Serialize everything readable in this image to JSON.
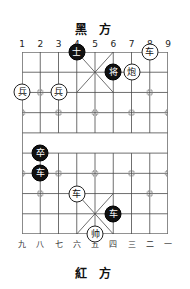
{
  "board": {
    "title_black": "黑 方",
    "title_red": "紅 方",
    "files": 9,
    "ranks": 10,
    "top_coords": [
      "1",
      "2",
      "3",
      "4",
      "5",
      "6",
      "7",
      "8",
      "9"
    ],
    "bottom_coords": [
      "九",
      "八",
      "七",
      "六",
      "五",
      "四",
      "三",
      "二",
      "一"
    ],
    "colors": {
      "line": "#4a4a4a",
      "border": "#6e6e6e",
      "black_piece_bg": "#111111",
      "black_piece_fg": "#ffffff",
      "red_piece_bg": "#ffffff",
      "red_piece_fg": "#111111",
      "background": "#ffffff"
    },
    "pieces": [
      {
        "glyph": "士",
        "side": "black",
        "file": 4,
        "rank": 0,
        "name": "black-advisor"
      },
      {
        "glyph": "车",
        "side": "red",
        "file": 8,
        "rank": 0,
        "name": "red-chariot-1"
      },
      {
        "glyph": "将",
        "side": "black",
        "file": 6,
        "rank": 1,
        "name": "black-general"
      },
      {
        "glyph": "炮",
        "side": "red",
        "file": 7,
        "rank": 1,
        "name": "red-cannon"
      },
      {
        "glyph": "兵",
        "side": "red",
        "file": 1,
        "rank": 2,
        "name": "red-soldier-1"
      },
      {
        "glyph": "兵",
        "side": "red",
        "file": 3,
        "rank": 2,
        "name": "red-soldier-2"
      },
      {
        "glyph": "卒",
        "side": "black",
        "file": 2,
        "rank": 5,
        "name": "black-soldier"
      },
      {
        "glyph": "车",
        "side": "black",
        "file": 2,
        "rank": 6,
        "name": "black-chariot-1"
      },
      {
        "glyph": "车",
        "side": "red",
        "file": 4,
        "rank": 7,
        "name": "red-chariot-2"
      },
      {
        "glyph": "车",
        "side": "black",
        "file": 6,
        "rank": 8,
        "name": "black-chariot-2"
      },
      {
        "glyph": "帅",
        "side": "red",
        "file": 5,
        "rank": 9,
        "name": "red-general"
      }
    ],
    "star_points": [
      {
        "file": 2,
        "rank": 2
      },
      {
        "file": 8,
        "rank": 2
      },
      {
        "file": 3,
        "rank": 3
      },
      {
        "file": 5,
        "rank": 3
      },
      {
        "file": 7,
        "rank": 3
      },
      {
        "file": 1,
        "rank": 3
      },
      {
        "file": 9,
        "rank": 3
      },
      {
        "file": 1,
        "rank": 6
      },
      {
        "file": 3,
        "rank": 6
      },
      {
        "file": 5,
        "rank": 6
      },
      {
        "file": 7,
        "rank": 6
      },
      {
        "file": 9,
        "rank": 6
      },
      {
        "file": 2,
        "rank": 7
      },
      {
        "file": 8,
        "rank": 7
      }
    ]
  }
}
